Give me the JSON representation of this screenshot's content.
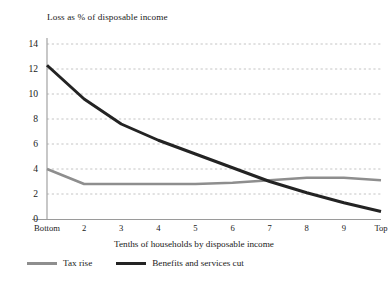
{
  "chart_data": {
    "type": "line",
    "title": "Loss as % of disposable income",
    "xlabel": "Tenths of households by disposable income",
    "ylabel": "",
    "categories": [
      "Bottom",
      "2",
      "3",
      "4",
      "5",
      "6",
      "7",
      "8",
      "9",
      "Top"
    ],
    "x_tick_labels": [
      "Bottom",
      "2",
      "3",
      "4",
      "5",
      "6",
      "7",
      "8",
      "9",
      "Top"
    ],
    "y_tick_labels": [
      "0",
      "2",
      "4",
      "6",
      "8",
      "10",
      "12",
      "14"
    ],
    "y_ticks": [
      0,
      2,
      4,
      6,
      8,
      10,
      12,
      14
    ],
    "ylim": [
      0,
      14.8
    ],
    "grid": "horizontal-dotted",
    "legend_position": "bottom-left",
    "series": [
      {
        "name": "Tax rise",
        "color": "#8e8e8e",
        "values": [
          4.0,
          2.8,
          2.8,
          2.8,
          2.8,
          2.9,
          3.1,
          3.3,
          3.3,
          3.1
        ]
      },
      {
        "name": "Benefits and services cut",
        "color": "#232323",
        "values": [
          12.3,
          9.6,
          7.6,
          6.3,
          5.2,
          4.1,
          3.0,
          2.1,
          1.3,
          0.6
        ]
      }
    ]
  },
  "axis": {
    "y_axis_name": "y-axis",
    "x_axis_name": "x-axis"
  },
  "legend": {
    "items": [
      {
        "label": "Tax rise",
        "color": "#8e8e8e"
      },
      {
        "label": "Benefits and services cut",
        "color": "#232323"
      }
    ]
  }
}
